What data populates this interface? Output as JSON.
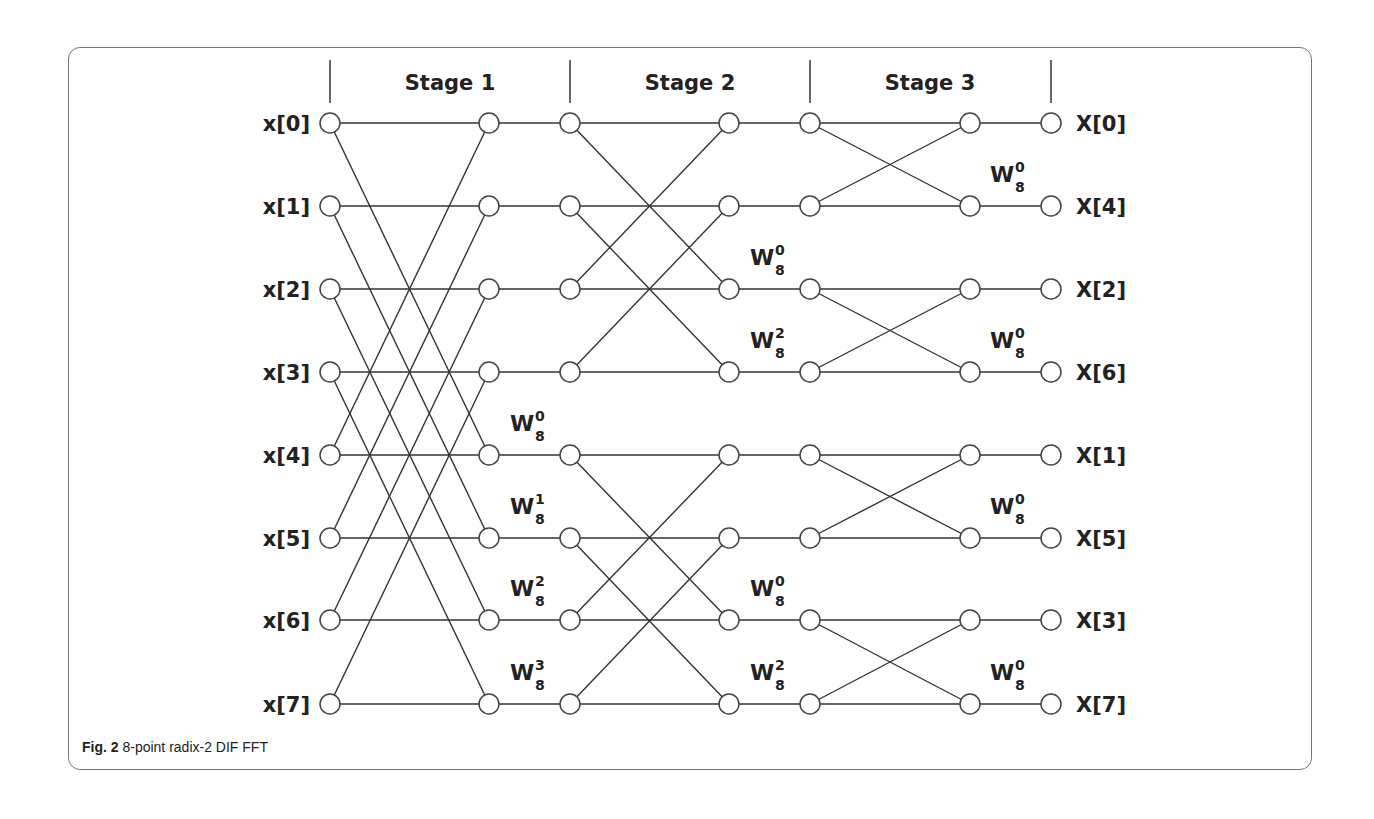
{
  "figure": {
    "caption_bold": "Fig. 2",
    "caption_text": " 8-point radix-2 DIF FFT"
  },
  "stages": [
    "Stage 1",
    "Stage 2",
    "Stage 3"
  ],
  "inputs": [
    "x[0]",
    "x[1]",
    "x[2]",
    "x[3]",
    "x[4]",
    "x[5]",
    "x[6]",
    "x[7]"
  ],
  "outputs": [
    "X[0]",
    "X[4]",
    "X[2]",
    "X[6]",
    "X[1]",
    "X[5]",
    "X[3]",
    "X[7]"
  ],
  "twiddles": {
    "stage1": [
      {
        "row": 4,
        "base": "W",
        "sub": "8",
        "sup": "0"
      },
      {
        "row": 5,
        "base": "W",
        "sub": "8",
        "sup": "1"
      },
      {
        "row": 6,
        "base": "W",
        "sub": "8",
        "sup": "2"
      },
      {
        "row": 7,
        "base": "W",
        "sub": "8",
        "sup": "3"
      }
    ],
    "stage2": [
      {
        "row": 2,
        "base": "W",
        "sub": "8",
        "sup": "0"
      },
      {
        "row": 3,
        "base": "W",
        "sub": "8",
        "sup": "2"
      },
      {
        "row": 6,
        "base": "W",
        "sub": "8",
        "sup": "0"
      },
      {
        "row": 7,
        "base": "W",
        "sub": "8",
        "sup": "2"
      }
    ],
    "stage3": [
      {
        "row": 1,
        "base": "W",
        "sub": "8",
        "sup": "0"
      },
      {
        "row": 3,
        "base": "W",
        "sub": "8",
        "sup": "0"
      },
      {
        "row": 5,
        "base": "W",
        "sub": "8",
        "sup": "0"
      },
      {
        "row": 7,
        "base": "W",
        "sub": "8",
        "sup": "0"
      }
    ]
  },
  "colors": {
    "line": "#333333",
    "node_stroke": "#444444",
    "node_fill": "#ffffff",
    "frame": "#777777"
  }
}
